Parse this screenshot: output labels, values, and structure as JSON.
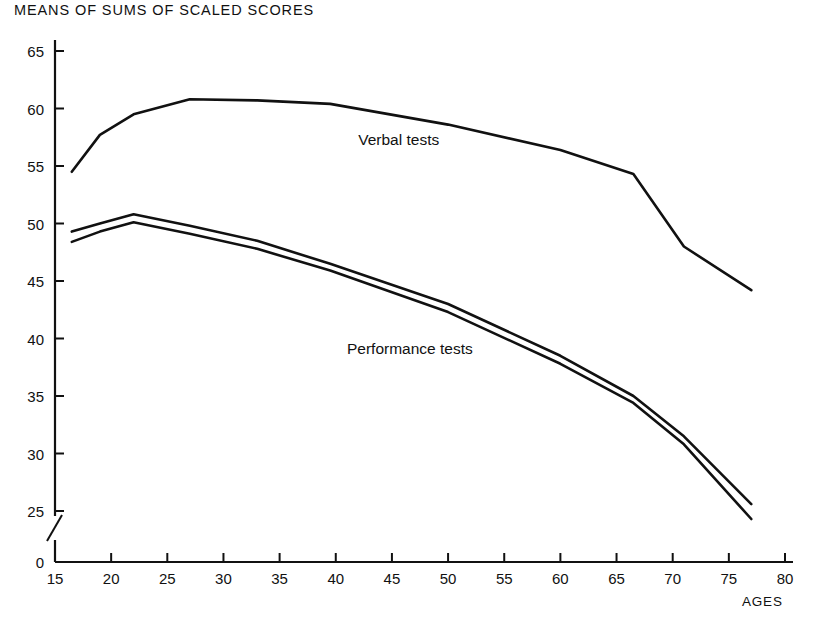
{
  "chart_data": {
    "type": "line",
    "title": "MEANS OF SUMS OF SCALED SCORES",
    "xlabel": "AGES",
    "ylabel": "",
    "xlim": [
      15,
      80
    ],
    "ylim": [
      0,
      66
    ],
    "y_axis_break": true,
    "y_break_between": [
      0,
      25
    ],
    "grid": false,
    "legend": "inline-annotations",
    "xticks": [
      "15",
      "20",
      "25",
      "30",
      "35",
      "40",
      "45",
      "50",
      "55",
      "60",
      "65",
      "70",
      "75",
      "80"
    ],
    "yticks": [
      "0",
      "25",
      "30",
      "35",
      "40",
      "45",
      "50",
      "55",
      "60",
      "65"
    ],
    "line_color": "#111111",
    "series": [
      {
        "name": "Verbal tests",
        "label_x": 42,
        "label_y": 57.2,
        "x": [
          16.5,
          19,
          22,
          27,
          33,
          39.5,
          50,
          60,
          66.5,
          71,
          77
        ],
        "values": [
          54.5,
          57.7,
          59.5,
          60.8,
          60.7,
          60.4,
          58.6,
          56.4,
          54.3,
          48.0,
          44.2
        ]
      },
      {
        "name": "Performance tests (upper)",
        "label_x": 41,
        "label_y": 39.0,
        "x": [
          16.5,
          19,
          22,
          27,
          33,
          39.5,
          50,
          60,
          66.5,
          71,
          77
        ],
        "values": [
          49.3,
          50.0,
          50.8,
          49.8,
          48.5,
          46.5,
          43.0,
          38.5,
          35.0,
          31.5,
          25.6
        ]
      },
      {
        "name": "Performance tests (lower)",
        "x": [
          16.5,
          19,
          22,
          27,
          33,
          39.5,
          50,
          60,
          66.5,
          71,
          77
        ],
        "values": [
          48.4,
          49.3,
          50.1,
          49.1,
          47.8,
          45.9,
          42.3,
          37.8,
          34.4,
          30.8,
          24.3
        ]
      }
    ],
    "annotations": [
      {
        "text": "Verbal tests",
        "x": 42,
        "y": 57.2
      },
      {
        "text": "Performance tests",
        "x": 41,
        "y": 39.0
      }
    ]
  }
}
